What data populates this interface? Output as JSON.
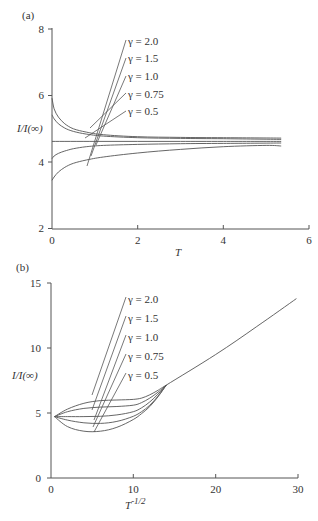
{
  "chart_data": [
    {
      "panel": "(a)",
      "type": "line",
      "xlabel": "T",
      "ylabel": "I/I(∞)",
      "xlim": [
        0,
        6
      ],
      "ylim": [
        2,
        8
      ],
      "xticks": [
        0,
        2,
        4,
        6
      ],
      "yticks": [
        2,
        4,
        6,
        8
      ],
      "grid": false,
      "series": [
        {
          "name": "γ = 2.0",
          "x": [
            0.0,
            0.05,
            0.15,
            0.3,
            0.5,
            0.8,
            1.2,
            2.0,
            3.0,
            4.0,
            5.35
          ],
          "y": [
            5.92,
            5.6,
            5.35,
            5.15,
            5.0,
            4.9,
            4.82,
            4.76,
            4.74,
            4.73,
            4.72
          ]
        },
        {
          "name": "γ = 1.5",
          "x": [
            0.0,
            0.05,
            0.15,
            0.3,
            0.5,
            0.8,
            1.2,
            2.0,
            3.0,
            4.0,
            5.35
          ],
          "y": [
            5.42,
            5.3,
            5.15,
            5.02,
            4.92,
            4.84,
            4.78,
            4.73,
            4.71,
            4.7,
            4.68
          ]
        },
        {
          "name": "γ = 1.0",
          "x": [
            0.0,
            1.0,
            2.0,
            3.0,
            4.0,
            5.35
          ],
          "y": [
            4.62,
            4.62,
            4.62,
            4.62,
            4.62,
            4.62
          ]
        },
        {
          "name": "γ = 0.75",
          "x": [
            0.0,
            0.05,
            0.15,
            0.3,
            0.5,
            0.8,
            1.2,
            2.0,
            3.0,
            4.0,
            5.35
          ],
          "y": [
            4.1,
            4.18,
            4.26,
            4.33,
            4.4,
            4.46,
            4.5,
            4.53,
            4.55,
            4.56,
            4.57
          ]
        },
        {
          "name": "γ = 0.5",
          "x": [
            0.0,
            0.05,
            0.15,
            0.3,
            0.5,
            0.8,
            1.2,
            2.0,
            3.0,
            4.0,
            5.0,
            5.35
          ],
          "y": [
            3.45,
            3.55,
            3.7,
            3.84,
            3.96,
            4.06,
            4.15,
            4.27,
            4.38,
            4.46,
            4.5,
            4.48
          ]
        }
      ],
      "legend": [
        "γ = 2.0",
        "γ = 1.5",
        "γ = 1.0",
        "γ = 0.75",
        "γ = 0.5"
      ],
      "legend_position": "annotated leaders, upper middle"
    },
    {
      "panel": "(b)",
      "type": "line",
      "xlabel": "T^-1/2",
      "ylabel": "I/I(∞)",
      "xlim": [
        0,
        30
      ],
      "ylim": [
        0,
        15
      ],
      "xticks": [
        0,
        10,
        20,
        30
      ],
      "yticks": [
        0,
        5,
        10,
        15
      ],
      "grid": false,
      "series": [
        {
          "name": "γ = 2.0",
          "x": [
            0.43,
            2,
            4,
            6,
            8,
            10,
            11,
            12,
            13,
            14,
            20,
            25,
            29.8
          ],
          "y": [
            4.72,
            5.3,
            5.75,
            5.95,
            6.0,
            6.05,
            6.15,
            6.4,
            6.75,
            7.15,
            9.5,
            11.65,
            13.8
          ]
        },
        {
          "name": "γ = 1.5",
          "x": [
            0.43,
            2,
            4,
            6,
            8,
            10,
            11,
            12,
            13,
            14
          ],
          "y": [
            4.72,
            5.1,
            5.35,
            5.45,
            5.5,
            5.6,
            5.8,
            6.15,
            6.6,
            7.15
          ]
        },
        {
          "name": "γ = 1.0",
          "x": [
            0.43,
            2,
            4,
            6,
            8,
            10,
            11,
            12,
            13,
            14
          ],
          "y": [
            4.72,
            4.72,
            4.72,
            4.75,
            4.85,
            5.1,
            5.4,
            5.85,
            6.45,
            7.15
          ]
        },
        {
          "name": "γ = 0.75",
          "x": [
            0.43,
            2,
            4,
            6,
            8,
            10,
            11,
            12,
            13,
            14
          ],
          "y": [
            4.72,
            4.45,
            4.25,
            4.2,
            4.35,
            4.75,
            5.1,
            5.6,
            6.3,
            7.15
          ]
        },
        {
          "name": "γ = 0.5",
          "x": [
            0.43,
            2,
            4,
            6,
            8,
            10,
            11,
            12,
            13,
            14
          ],
          "y": [
            4.72,
            3.95,
            3.6,
            3.6,
            3.9,
            4.5,
            4.95,
            5.5,
            6.25,
            7.15
          ]
        }
      ],
      "legend": [
        "γ = 2.0",
        "γ = 1.5",
        "γ = 1.0",
        "γ = 0.75",
        "γ = 0.5"
      ],
      "legend_position": "annotated leaders, upper middle"
    }
  ],
  "panels": {
    "a": {
      "label": "(a)",
      "ylabel": "I/I(∞)",
      "xlabel": "T",
      "yticks": [
        "8",
        "6",
        "4",
        "2"
      ],
      "xticks": [
        "0",
        "2",
        "4",
        "6"
      ],
      "legend": [
        "γ = 2.0",
        "γ = 1.5",
        "γ = 1.0",
        "γ = 0.75",
        "γ = 0.5"
      ]
    },
    "b": {
      "label": "(b)",
      "ylabel": "I/I(∞)",
      "xlabel_base": "T",
      "xlabel_sup": "-1/2",
      "yticks": [
        "15",
        "10",
        "5",
        "0"
      ],
      "xticks": [
        "0",
        "10",
        "20",
        "30"
      ],
      "legend": [
        "γ = 2.0",
        "γ = 1.5",
        "γ = 1.0",
        "γ = 0.75",
        "γ = 0.5"
      ]
    }
  }
}
